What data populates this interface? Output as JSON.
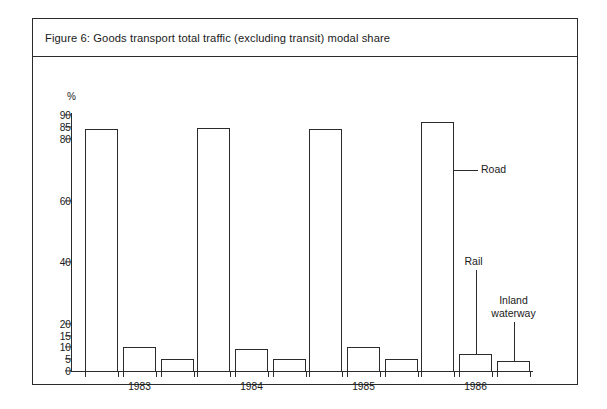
{
  "figure": {
    "title": "Figure 6: Goods transport total traffic (excluding transit) modal share"
  },
  "chart_data": {
    "type": "bar",
    "title": "Figure 6: Goods transport total traffic (excluding transit) modal share",
    "xlabel": "",
    "ylabel": "%",
    "y_unit": "%",
    "categories": [
      "1983",
      "1984",
      "1985",
      "1986"
    ],
    "series": [
      {
        "name": "Road",
        "values": [
          84,
          84.5,
          84,
          87
        ]
      },
      {
        "name": "Rail",
        "values": [
          10,
          9,
          10,
          7
        ]
      },
      {
        "name": "Inland waterway",
        "values": [
          5,
          5,
          5,
          4
        ]
      }
    ],
    "yticks": [
      0,
      5,
      10,
      15,
      20,
      40,
      60,
      80,
      85,
      90
    ],
    "ytick_labels": [
      "0",
      "5",
      "10",
      "15",
      "20",
      "40",
      "60",
      "80",
      "85",
      "90"
    ],
    "ylim": [
      0,
      90
    ],
    "axis_note": "non-linear (compressed) vertical scale between 20 and 80",
    "grid": false,
    "legend": "annotations with leader lines on 1986 group",
    "annotations": [
      {
        "text": "Road",
        "target": "1986 Road bar"
      },
      {
        "text": "Rail",
        "target": "1986 Rail bar"
      },
      {
        "text": "Inland waterway",
        "line1": "Inland",
        "line2": "waterway",
        "target": "1986 Inland waterway bar"
      }
    ]
  },
  "annotations": {
    "road": "Road",
    "rail": "Rail",
    "inland_line1": "Inland",
    "inland_line2": "waterway"
  },
  "colors": {
    "ink": "#2b2b2b",
    "background": "#ffffff"
  }
}
